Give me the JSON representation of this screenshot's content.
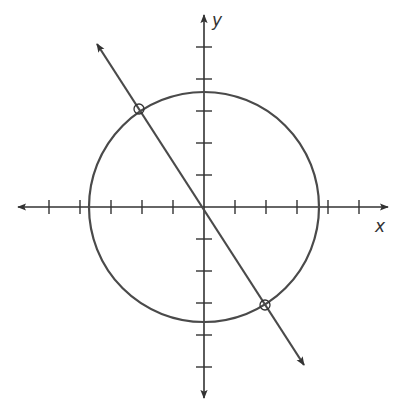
{
  "diagram": {
    "type": "coordinate-plane",
    "labels": {
      "x_axis": "x",
      "y_axis": "y"
    },
    "colors": {
      "stroke": "#4a4a4a",
      "background": "#ffffff"
    },
    "origin_px": [
      204,
      207
    ],
    "unit_px": 31,
    "x_ticks": [
      -5,
      -4,
      -3,
      -2,
      -1,
      1,
      2,
      3,
      4,
      5
    ],
    "y_ticks": [
      -5,
      -4,
      -3,
      -2,
      -1,
      1,
      2,
      3,
      4,
      5
    ],
    "circle": {
      "center": [
        0,
        0
      ],
      "radius_units": 3.7
    },
    "line": {
      "through_origin": true,
      "slope_direction": "negative"
    },
    "intersection_points": 2
  }
}
